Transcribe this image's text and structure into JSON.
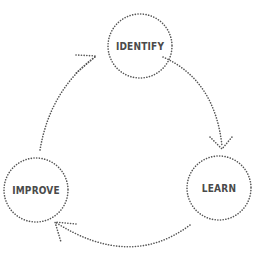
{
  "diagram": {
    "type": "cycle",
    "nodes": [
      {
        "id": "identify",
        "label": "IDENTIFY"
      },
      {
        "id": "learn",
        "label": "LEARN"
      },
      {
        "id": "improve",
        "label": "IMPROVE"
      }
    ],
    "edges": [
      {
        "from": "identify",
        "to": "learn"
      },
      {
        "from": "learn",
        "to": "improve"
      },
      {
        "from": "improve",
        "to": "identify"
      }
    ],
    "colors": {
      "stroke": "#555555",
      "text": "#4a4a4a",
      "background": "#ffffff"
    }
  }
}
